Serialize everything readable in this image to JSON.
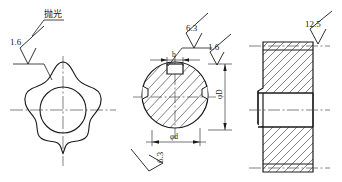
{
  "drawing": {
    "background_color": "#ffffff",
    "line_color": "#1a1a1a",
    "centerline_color": "#4d4d4d",
    "views": [
      {
        "id": "front-view-knob",
        "name": "six-lobe-knob-front-view",
        "description": "six lobed star knob outline with central bore and centerlines"
      },
      {
        "id": "section-view-shaft",
        "name": "shaft-cross-section-view",
        "description": "circular cross section with keyway and side notches, hatched"
      },
      {
        "id": "side-section-view",
        "name": "stepped-hub-section-view",
        "description": "stepped hub half section with hatching and bore"
      }
    ],
    "annotations": {
      "polish_note": "抛光",
      "roughness_1": "1.6",
      "roughness_2": "6.3",
      "roughness_3": "1.6",
      "roughness_4": "6.3",
      "roughness_5": "12.5"
    },
    "dimensions": {
      "keyway_width": "b",
      "bore_diameter": "φd",
      "outer_diameter": "φD"
    }
  }
}
